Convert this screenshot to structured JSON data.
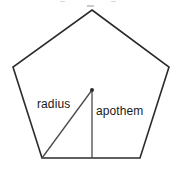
{
  "figure": {
    "shape": "regular pentagon",
    "background_color": "#ffffff",
    "outline_color": "#2b2b2b",
    "segment_color": "#4a4a4a",
    "text_color": "#1a1a1a"
  },
  "labels": {
    "radius": "radius",
    "apothem": "apothem"
  },
  "geometry": {
    "pentagon_vertices": [
      {
        "name": "top",
        "x": 92,
        "y": 10
      },
      {
        "name": "right",
        "x": 169,
        "y": 67
      },
      {
        "name": "bottom-right",
        "x": 140,
        "y": 158
      },
      {
        "name": "bottom-left",
        "x": 42,
        "y": 158
      },
      {
        "name": "left",
        "x": 13,
        "y": 67
      }
    ],
    "center": {
      "x": 92,
      "y": 90
    },
    "radius_segment": {
      "from": {
        "x": 92,
        "y": 90
      },
      "to": {
        "x": 42,
        "y": 158
      }
    },
    "apothem_segment": {
      "from": {
        "x": 92,
        "y": 90
      },
      "to": {
        "x": 92,
        "y": 158
      }
    }
  }
}
